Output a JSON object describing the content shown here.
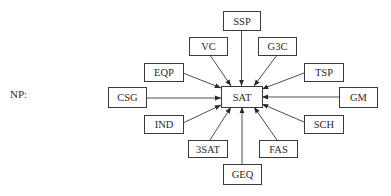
{
  "label": "NP:",
  "center": {
    "id": "SAT",
    "label": "SAT",
    "x": 221,
    "y": 86,
    "w": 41,
    "h": 21
  },
  "nodes": [
    {
      "id": "SSP",
      "label": "SSP",
      "x": 223,
      "y": 11,
      "w": 37,
      "h": 19
    },
    {
      "id": "VC",
      "label": "VC",
      "x": 189,
      "y": 37,
      "w": 38,
      "h": 18
    },
    {
      "id": "G3C",
      "label": "G3C",
      "x": 258,
      "y": 37,
      "w": 38,
      "h": 18
    },
    {
      "id": "EQP",
      "label": "EQP",
      "x": 144,
      "y": 63,
      "w": 39,
      "h": 18
    },
    {
      "id": "TSP",
      "label": "TSP",
      "x": 304,
      "y": 63,
      "w": 39,
      "h": 18
    },
    {
      "id": "CSG",
      "label": "CSG",
      "x": 108,
      "y": 87,
      "w": 38,
      "h": 20
    },
    {
      "id": "GM",
      "label": "GM",
      "x": 339,
      "y": 87,
      "w": 38,
      "h": 20
    },
    {
      "id": "IND",
      "label": "IND",
      "x": 144,
      "y": 115,
      "w": 39,
      "h": 18
    },
    {
      "id": "SCH",
      "label": "SCH",
      "x": 304,
      "y": 115,
      "w": 39,
      "h": 18
    },
    {
      "id": "3SAT",
      "label": "3SAT",
      "x": 188,
      "y": 140,
      "w": 39,
      "h": 17
    },
    {
      "id": "FAS",
      "label": "FAS",
      "x": 259,
      "y": 140,
      "w": 38,
      "h": 17
    },
    {
      "id": "GEQ",
      "label": "GEQ",
      "x": 223,
      "y": 164,
      "w": 38,
      "h": 20
    }
  ],
  "edges": [
    {
      "from": "SSP",
      "to": "SAT",
      "x1": 241.5,
      "y1": 30,
      "x2": 241.5,
      "y2": 86
    },
    {
      "from": "VC",
      "to": "SAT",
      "x1": 210,
      "y1": 55,
      "x2": 231,
      "y2": 86
    },
    {
      "from": "G3C",
      "to": "SAT",
      "x1": 277,
      "y1": 55,
      "x2": 254,
      "y2": 86
    },
    {
      "from": "EQP",
      "to": "SAT",
      "x1": 183,
      "y1": 73,
      "x2": 221,
      "y2": 88
    },
    {
      "from": "TSP",
      "to": "SAT",
      "x1": 304,
      "y1": 73,
      "x2": 262,
      "y2": 89
    },
    {
      "from": "CSG",
      "to": "SAT",
      "x1": 146,
      "y1": 98,
      "x2": 221,
      "y2": 98
    },
    {
      "from": "GM",
      "to": "SAT",
      "x1": 339,
      "y1": 97,
      "x2": 262,
      "y2": 97
    },
    {
      "from": "IND",
      "to": "SAT",
      "x1": 183,
      "y1": 123,
      "x2": 221,
      "y2": 105
    },
    {
      "from": "SCH",
      "to": "SAT",
      "x1": 304,
      "y1": 122,
      "x2": 262,
      "y2": 104
    },
    {
      "from": "3SAT",
      "to": "SAT",
      "x1": 210,
      "y1": 140,
      "x2": 231,
      "y2": 107
    },
    {
      "from": "FAS",
      "to": "SAT",
      "x1": 277,
      "y1": 140,
      "x2": 254,
      "y2": 107
    },
    {
      "from": "GEQ",
      "to": "SAT",
      "x1": 242,
      "y1": 164,
      "x2": 242,
      "y2": 107
    }
  ]
}
